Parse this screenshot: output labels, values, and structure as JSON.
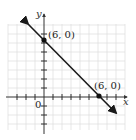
{
  "diagram": {
    "type": "coordinate-plane-line",
    "x_axis_label": "x",
    "y_axis_label": "y",
    "origin_label": "0",
    "points": [
      {
        "label": "(6, 0)",
        "x": 0,
        "y": 6,
        "role": "y-intercept"
      },
      {
        "label": "(6, 0)",
        "x": 6,
        "y": 0,
        "role": "x-intercept"
      }
    ],
    "line": {
      "slope": -1,
      "intercept": 6,
      "arrows": "both"
    },
    "grid": true,
    "colors": {
      "line": "#1a1a1a",
      "grid": "#d8d8d8",
      "axis": "#333333"
    }
  }
}
